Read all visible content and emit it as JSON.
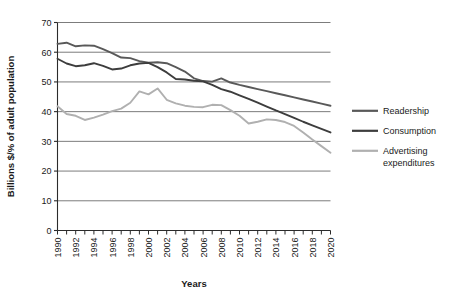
{
  "chart_data": {
    "type": "line",
    "title": "",
    "xlabel": "Years",
    "ylabel": "Billions $/% of adult population",
    "ylim": [
      0,
      70
    ],
    "ytick_step": 10,
    "yticks": [
      "0",
      "10",
      "20",
      "30",
      "40",
      "50",
      "60",
      "70"
    ],
    "xlim": [
      1990,
      2020
    ],
    "xtick_step": 1,
    "xtick_labels": [
      "1990",
      "1992",
      "1994",
      "1996",
      "1998",
      "2000",
      "2002",
      "2004",
      "2006",
      "2008",
      "2010",
      "2012",
      "2014",
      "2016",
      "2018",
      "2020"
    ],
    "x": [
      1990,
      1991,
      1992,
      1993,
      1994,
      1995,
      1996,
      1997,
      1998,
      1999,
      2000,
      2001,
      2002,
      2003,
      2004,
      2005,
      2006,
      2007,
      2008,
      2009,
      2010,
      2011,
      2012,
      2013,
      2014,
      2015,
      2016,
      2017,
      2018,
      2019,
      2020
    ],
    "grid": "horizontal",
    "legend_position": "right",
    "series": [
      {
        "name": "Readership",
        "color": "#595959",
        "values": [
          62.8,
          63.2,
          62.0,
          62.3,
          62.2,
          61.0,
          59.7,
          58.2,
          58.0,
          57.0,
          56.5,
          56.6,
          56.3,
          55.0,
          53.5,
          51.2,
          50.3,
          50.1,
          51.2,
          49.8,
          49.0,
          48.3,
          47.6,
          46.9,
          46.2,
          45.5,
          44.8,
          44.1,
          43.4,
          42.7,
          42.0
        ]
      },
      {
        "name": "Consumption",
        "color": "#3d3d3d",
        "values": [
          57.8,
          56.2,
          55.3,
          55.6,
          56.3,
          55.4,
          54.2,
          54.5,
          55.6,
          56.2,
          56.4,
          55.0,
          53.2,
          51.0,
          50.8,
          50.4,
          50.2,
          49.0,
          47.6,
          46.7,
          45.5,
          44.3,
          43.0,
          41.7,
          40.4,
          39.2,
          37.9,
          36.6,
          35.4,
          34.2,
          33.0
        ]
      },
      {
        "name": "Advertising expenditures",
        "color": "#b0b0b0",
        "values": [
          41.8,
          39.2,
          38.6,
          37.2,
          38.0,
          39.0,
          40.2,
          41.0,
          43.0,
          46.8,
          45.8,
          47.8,
          44.0,
          42.8,
          42.0,
          41.6,
          41.5,
          42.3,
          42.2,
          40.5,
          38.6,
          36.0,
          36.6,
          37.4,
          37.2,
          36.5,
          35.2,
          33.0,
          30.6,
          28.4,
          26.2
        ]
      }
    ]
  },
  "legend": {
    "items": [
      {
        "label": "Readership"
      },
      {
        "label": "Consumption"
      },
      {
        "label": "Advertising"
      },
      {
        "label": "expenditures"
      }
    ]
  }
}
